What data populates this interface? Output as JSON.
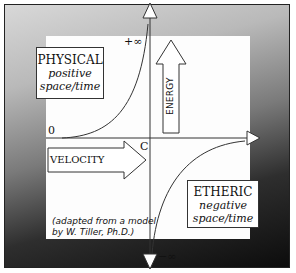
{
  "diagram": {
    "type": "hyperbolic energy-velocity diagram",
    "quadrants": {
      "upper_left": {
        "title": "PHYSICAL",
        "subtitle_line1": "positive",
        "subtitle_line2": "space/time"
      },
      "lower_right": {
        "title": "ETHERIC",
        "subtitle_line1": "negative",
        "subtitle_line2": "space/time"
      }
    },
    "axes": {
      "vertical_label": "ENERGY",
      "horizontal_label": "VELOCITY",
      "top_marker": "+∞",
      "bottom_marker": "−∞",
      "origin_marker": "0",
      "center_marker": "C"
    },
    "credit": {
      "line1": "(adapted from a model",
      "line2": "by W. Tiller, Ph.D.)"
    },
    "colors": {
      "line": "#222222",
      "panel": "#fdfdfd",
      "gradient_light": "#d8d8d8",
      "gradient_dark": "#0c0c0c"
    }
  }
}
